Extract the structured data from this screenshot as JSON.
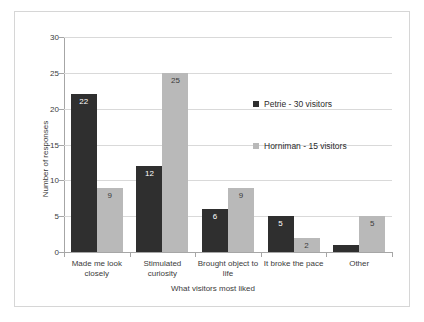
{
  "chart_data": {
    "type": "bar",
    "title": "",
    "xlabel": "What visitors most liked",
    "ylabel": "Number of responses",
    "ylim": [
      0,
      30
    ],
    "yticks": [
      0,
      5,
      10,
      15,
      20,
      25,
      30
    ],
    "grid": true,
    "legend_position": "inside-right",
    "categories": [
      "Made me look closely",
      "Stimulated curiosity",
      "Brought object to life",
      "It broke the pace",
      "Other"
    ],
    "series": [
      {
        "name": "Petrie - 30 visitors",
        "color": "#2f2f2f",
        "values": [
          22,
          12,
          6,
          5,
          1
        ],
        "labels": [
          "22",
          "12",
          "6",
          "5",
          ""
        ]
      },
      {
        "name": "Horniman - 15 visitors",
        "color": "#b9b9b9",
        "values": [
          9,
          25,
          9,
          2,
          5
        ],
        "labels": [
          "9",
          "25",
          "9",
          "2",
          "5"
        ]
      }
    ]
  },
  "axis": {
    "y_tick_labels": [
      "30",
      "25",
      "20",
      "15",
      "10",
      "5",
      "0"
    ],
    "y_title": "Number of responses",
    "x_title": "What visitors most liked",
    "category_lines": [
      [
        "Made me look",
        "closely"
      ],
      [
        "Stimulated",
        "curiosity"
      ],
      [
        "Brought object to",
        "life"
      ],
      [
        "It broke the pace",
        ""
      ],
      [
        "Other",
        ""
      ]
    ]
  },
  "legend": {
    "entries": [
      {
        "label": "Petrie - 30 visitors",
        "color": "#2f2f2f"
      },
      {
        "label": "Horniman - 15 visitors",
        "color": "#b9b9b9"
      }
    ]
  }
}
